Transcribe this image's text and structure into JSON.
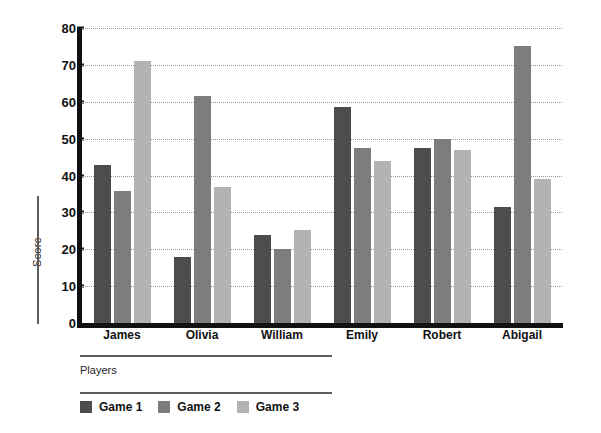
{
  "chart_data": {
    "type": "bar",
    "title": "",
    "xlabel": "Players",
    "ylabel": "Score",
    "categories": [
      "James",
      "Olivia",
      "William",
      "Emily",
      "Robert",
      "Abigail"
    ],
    "series": [
      {
        "name": "Game 1",
        "color": "#4d4d4d",
        "values": [
          42.8,
          17.8,
          24.0,
          58.5,
          47.5,
          31.5
        ]
      },
      {
        "name": "Game 2",
        "color": "#7d7d7d",
        "values": [
          35.8,
          61.5,
          20.0,
          47.5,
          50.0,
          75.0
        ]
      },
      {
        "name": "Game 3",
        "color": "#b3b3b3",
        "values": [
          71.0,
          37.0,
          25.3,
          44.0,
          47.0,
          39.0
        ]
      }
    ],
    "ylim": [
      0,
      80
    ],
    "yticks": [
      0,
      10,
      20,
      30,
      40,
      50,
      60,
      70,
      80
    ],
    "ytick_labels": [
      "0",
      "10",
      "20",
      "30",
      "40",
      "50",
      "60",
      "70",
      "80"
    ],
    "grid": true,
    "grid_style": "dotted",
    "legend_position": "bottom-left",
    "orientation": "vertical"
  },
  "legend": {
    "items": [
      {
        "label": "Game 1"
      },
      {
        "label": "Game 2"
      },
      {
        "label": "Game 3"
      }
    ]
  },
  "colors": {
    "series_1": "#4d4d4d",
    "series_2": "#7d7d7d",
    "series_3": "#b3b3b3",
    "axis": "#111111",
    "grid": "#9a9a9a",
    "rule": "#5d5d5d",
    "background": "#ffffff"
  }
}
